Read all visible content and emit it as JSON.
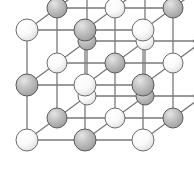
{
  "figure": {
    "kind": "3d-lattice-diagram",
    "width": 194,
    "height": 173,
    "background": "#ffffff"
  },
  "chart_data": {
    "type": "scatter",
    "xlabel": "",
    "ylabel": "",
    "projection": "oblique / cabinet",
    "grid": true,
    "legend_position": "none",
    "lattice": {
      "nx": 3,
      "ny": 3,
      "nz": 3,
      "front_origin": [
        27,
        140
      ],
      "step_x": 58,
      "step_y": -55,
      "depth_vector": [
        30,
        -22
      ],
      "sphere_radius_front": 11,
      "sphere_radius_back": 9
    },
    "species": [
      {
        "name": "anion-light",
        "color": "#f2f2f2",
        "edge": "#6d6d6d",
        "role": "large light sphere"
      },
      {
        "name": "cation-dark",
        "color": "#b6b6b6",
        "edge": "#5a5a5a",
        "role": "shaded gray sphere"
      }
    ],
    "bond_color": "#7a7a7a",
    "bond_width": 1.3,
    "points": [
      {
        "i": 0,
        "j": 0,
        "k": 0,
        "species": "anion-light"
      },
      {
        "i": 1,
        "j": 0,
        "k": 0,
        "species": "cation-dark"
      },
      {
        "i": 2,
        "j": 0,
        "k": 0,
        "species": "anion-light"
      },
      {
        "i": 0,
        "j": 1,
        "k": 0,
        "species": "cation-dark"
      },
      {
        "i": 1,
        "j": 1,
        "k": 0,
        "species": "anion-light"
      },
      {
        "i": 2,
        "j": 1,
        "k": 0,
        "species": "cation-dark"
      },
      {
        "i": 0,
        "j": 2,
        "k": 0,
        "species": "anion-light"
      },
      {
        "i": 1,
        "j": 2,
        "k": 0,
        "species": "cation-dark"
      },
      {
        "i": 2,
        "j": 2,
        "k": 0,
        "species": "anion-light"
      },
      {
        "i": 0,
        "j": 0,
        "k": 1,
        "species": "cation-dark"
      },
      {
        "i": 1,
        "j": 0,
        "k": 1,
        "species": "anion-light"
      },
      {
        "i": 2,
        "j": 0,
        "k": 1,
        "species": "cation-dark"
      },
      {
        "i": 0,
        "j": 1,
        "k": 1,
        "species": "anion-light"
      },
      {
        "i": 1,
        "j": 1,
        "k": 1,
        "species": "cation-dark"
      },
      {
        "i": 2,
        "j": 1,
        "k": 1,
        "species": "anion-light"
      },
      {
        "i": 0,
        "j": 2,
        "k": 1,
        "species": "cation-dark"
      },
      {
        "i": 1,
        "j": 2,
        "k": 1,
        "species": "anion-light"
      },
      {
        "i": 2,
        "j": 2,
        "k": 1,
        "species": "cation-dark"
      },
      {
        "i": 0,
        "j": 0,
        "k": 2,
        "species": "anion-light"
      },
      {
        "i": 1,
        "j": 0,
        "k": 2,
        "species": "cation-dark"
      },
      {
        "i": 2,
        "j": 0,
        "k": 2,
        "species": "anion-light"
      },
      {
        "i": 0,
        "j": 1,
        "k": 2,
        "species": "cation-dark"
      },
      {
        "i": 1,
        "j": 1,
        "k": 2,
        "species": "anion-light"
      },
      {
        "i": 2,
        "j": 1,
        "k": 2,
        "species": "cation-dark"
      },
      {
        "i": 0,
        "j": 2,
        "k": 2,
        "species": "anion-light"
      },
      {
        "i": 1,
        "j": 2,
        "k": 2,
        "species": "cation-dark"
      },
      {
        "i": 2,
        "j": 2,
        "k": 2,
        "species": "anion-light"
      }
    ]
  }
}
